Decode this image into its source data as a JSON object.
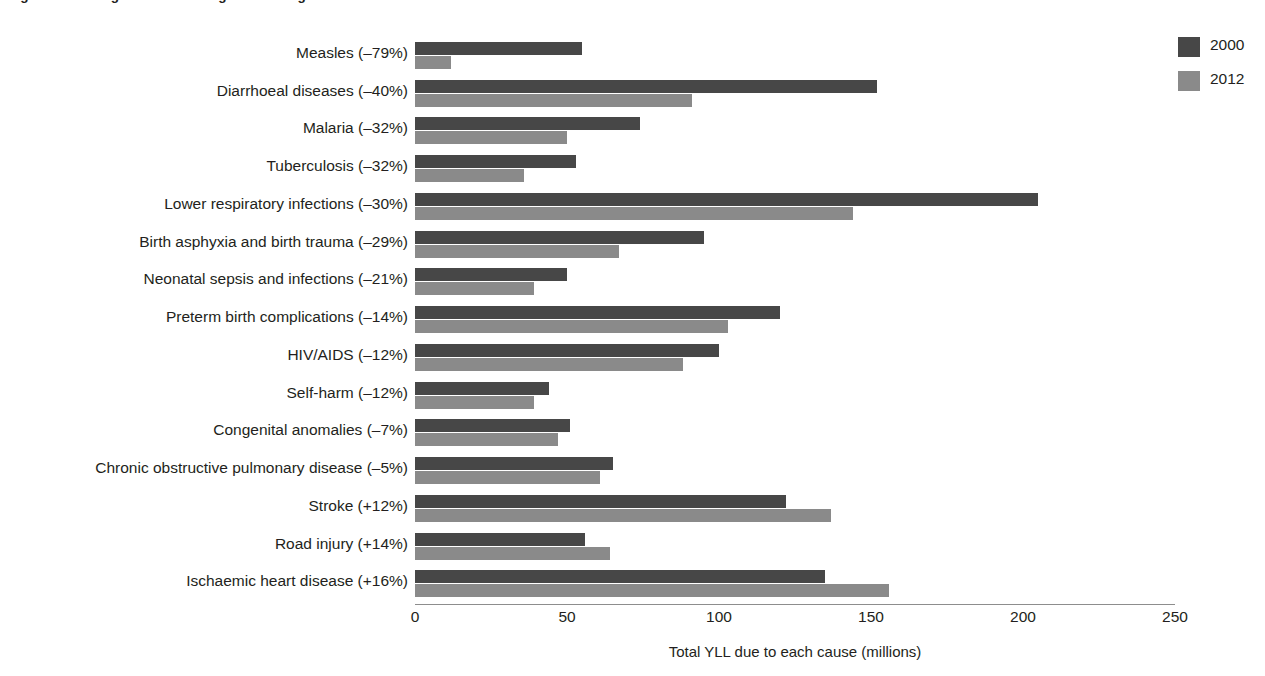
{
  "figure": {
    "caption": "Figure 2.3  Changes in the leading causes of global YLL between 2000 and 2012"
  },
  "legend": {
    "position": "top-right",
    "items": [
      {
        "label": "2000",
        "color": "#474747"
      },
      {
        "label": "2012",
        "color": "#8a8a8a"
      }
    ]
  },
  "axis": {
    "x_title": "Total YLL due to each cause (millions)",
    "ticks": [
      "0",
      "50",
      "100",
      "150",
      "200",
      "250"
    ],
    "tick_values": [
      0,
      50,
      100,
      150,
      200,
      250
    ],
    "min": 0,
    "max": 250
  },
  "chart_data": {
    "type": "bar",
    "orientation": "horizontal",
    "title": "Figure 2.3  Changes in the leading causes of global YLL between 2000 and 2012",
    "xlabel": "Total YLL due to each cause (millions)",
    "ylabel": "",
    "xlim": [
      0,
      250
    ],
    "grid": false,
    "legend_position": "top-right",
    "categories": [
      "Measles (–79%)",
      "Diarrhoeal diseases (–40%)",
      "Malaria (–32%)",
      "Tuberculosis (–32%)",
      "Lower respiratory infections (–30%)",
      "Birth asphyxia and birth trauma (–29%)",
      "Neonatal sepsis and infections (–21%)",
      "Preterm birth complications (–14%)",
      "HIV/AIDS (–12%)",
      "Self-harm (–12%)",
      "Congenital anomalies  (–7%)",
      "Chronic obstructive pulmonary disease  (–5%)",
      "Stroke (+12%)",
      "Road injury (+14%)",
      "Ischaemic heart disease (+16%)"
    ],
    "series": [
      {
        "name": "2000",
        "color": "#474747",
        "values": [
          55,
          152,
          74,
          53,
          205,
          95,
          50,
          120,
          100,
          44,
          51,
          65,
          122,
          56,
          135
        ]
      },
      {
        "name": "2012",
        "color": "#8a8a8a",
        "values": [
          12,
          91,
          50,
          36,
          144,
          67,
          39,
          103,
          88,
          39,
          47,
          61,
          137,
          64,
          156
        ]
      }
    ],
    "percent_change": [
      "-79%",
      "-40%",
      "-32%",
      "-32%",
      "-30%",
      "-29%",
      "-21%",
      "-14%",
      "-12%",
      "-12%",
      "-7%",
      "-5%",
      "+12%",
      "+14%",
      "+16%"
    ]
  }
}
